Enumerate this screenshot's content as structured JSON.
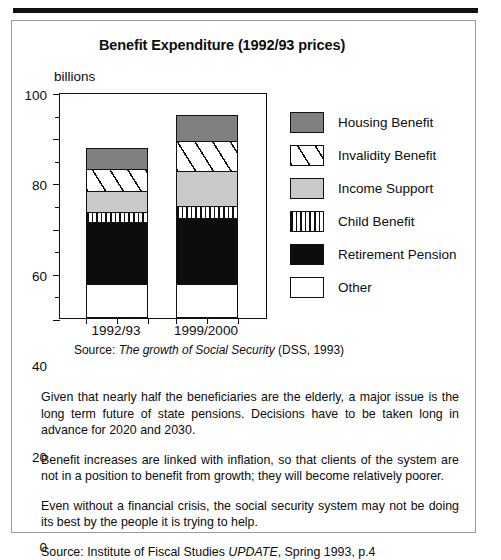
{
  "figure": {
    "title": "Benefit Expenditure (1992/93 prices)",
    "unit_label": "billions",
    "source_prefix": "Source: ",
    "source_italic": "The growth of Social Security",
    "source_suffix": " (DSS, 1993)"
  },
  "chart_data": {
    "type": "bar",
    "title": "Benefit Expenditure (1992/93 prices)",
    "subtitle": "",
    "xlabel": "",
    "ylabel": "billions",
    "ylim": [
      0,
      100
    ],
    "yticks": [
      0,
      20,
      40,
      60,
      80,
      100
    ],
    "ytick_labels": [
      "0",
      "20",
      "40",
      "60",
      "80",
      "100"
    ],
    "yticks_minor": [
      10,
      30,
      50,
      70,
      90
    ],
    "grid": false,
    "stacked": true,
    "legend_position": "right",
    "categories": [
      "1992/93",
      "1999/2000"
    ],
    "series": [
      {
        "name": "Other",
        "values": [
          15,
          15
        ]
      },
      {
        "name": "Retirement Pension",
        "values": [
          28,
          30
        ]
      },
      {
        "name": "Child Benefit",
        "values": [
          5,
          5.5
        ]
      },
      {
        "name": "Income Support",
        "values": [
          10,
          16
        ]
      },
      {
        "name": "Invalidity Benefit",
        "values": [
          10,
          14
        ]
      },
      {
        "name": "Housing Benefit",
        "values": [
          10,
          12
        ]
      }
    ],
    "totals": [
      78,
      92.5
    ],
    "annotation": "Source: The growth of Social Security (DSS, 1993)"
  },
  "legend": {
    "items": [
      {
        "label": "Housing Benefit",
        "swatch": "sw-housing",
        "color": "#808080"
      },
      {
        "label": "Invalidity Benefit",
        "swatch": "sw-invalidity",
        "color": "#ffffff"
      },
      {
        "label": "Income Support",
        "swatch": "sw-income",
        "color": "#c9c9c9"
      },
      {
        "label": "Child Benefit",
        "swatch": "sw-child",
        "color": "#ffffff"
      },
      {
        "label": "Retirement Pension",
        "swatch": "sw-pension",
        "color": "#0d0d0d"
      },
      {
        "label": "Other",
        "swatch": "sw-other",
        "color": "#ffffff"
      }
    ]
  },
  "prose": {
    "paragraph_1": "Given that nearly half the beneficiaries are the elderly, a major issue is the long term future of state pensions. Decisions have to be taken long in advance for 2020 and 2030.",
    "paragraph_2": "Benefit increases are linked with inflation, so that clients of the system are not in a position to benefit from growth; they will become relatively poorer.",
    "paragraph_3": "Even without a financial crisis, the social security system may not be doing its best by the people it is trying to help.",
    "source_prefix": "Source: Institute of Fiscal Studies ",
    "source_italic": "UPDATE",
    "source_suffix": ", Spring 1993, p.4"
  }
}
